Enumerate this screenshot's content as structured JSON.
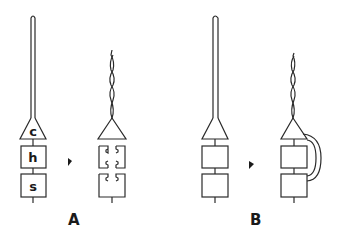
{
  "diagram": {
    "panels": [
      {
        "id": "A",
        "label": "A",
        "before": {
          "segments": [
            "c",
            "h",
            "s"
          ]
        },
        "arrow": "right-arrow",
        "after": {
          "description": "cone with twisted fiber; boxes with notched (broken) links"
        }
      },
      {
        "id": "B",
        "label": "B",
        "before": {
          "segments": [
            "",
            "",
            ""
          ]
        },
        "arrow": "right-arrow",
        "after": {
          "description": "cone with twisted fiber; curved bridge from cone to lower box"
        }
      }
    ],
    "colors": {
      "stroke": "#2a2a2a",
      "background": "#ffffff"
    }
  }
}
